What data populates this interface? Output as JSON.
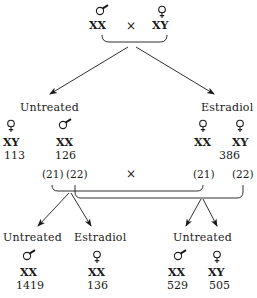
{
  "parents": {
    "male": {
      "symbol": "male-icon",
      "genotype": "XX"
    },
    "cross": "×",
    "female": {
      "symbol": "female-icon",
      "genotype": "XY"
    }
  },
  "generation1": {
    "untreated": {
      "label": "Untreated",
      "offspring": [
        {
          "symbol": "female-icon",
          "genotype": "XY",
          "count": "113"
        },
        {
          "symbol": "male-icon",
          "genotype": "XX",
          "count": "126"
        }
      ]
    },
    "estradiol": {
      "label": "Estradiol",
      "offspring": [
        {
          "symbol": "female-icon",
          "genotype": "XX"
        },
        {
          "symbol": "female-icon",
          "genotype": "XY"
        }
      ],
      "count": "386"
    }
  },
  "cross2": {
    "ids": [
      "(21)",
      "(22)",
      "(21)",
      "(22)"
    ],
    "cross": "×"
  },
  "generation2": {
    "left_untreated": {
      "label": "Untreated",
      "symbol": "male-icon",
      "genotype": "XX",
      "count": "1419"
    },
    "left_estradiol": {
      "label": "Estradiol",
      "symbol": "female-icon",
      "genotype": "XX",
      "count": "136"
    },
    "right_untreated": {
      "label": "Untreated",
      "offspring": [
        {
          "symbol": "male-icon",
          "genotype": "XX",
          "count": "529"
        },
        {
          "symbol": "female-icon",
          "genotype": "XY",
          "count": "505"
        }
      ]
    }
  },
  "colors": {
    "ink": "#1a1a1a",
    "background": "#ffffff"
  }
}
